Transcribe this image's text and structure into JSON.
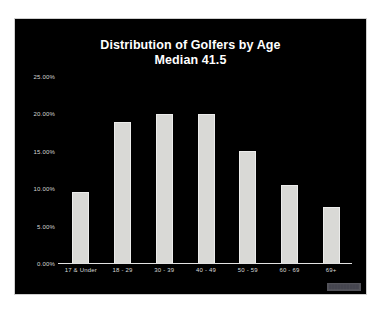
{
  "slide": {
    "background_color": "#000000",
    "band_color": "#8d8d8d",
    "watermark": "██████████"
  },
  "chart_data": {
    "type": "bar",
    "title": "Distribution of Golfers by Age",
    "subtitle": "Median 41.5",
    "xlabel": "",
    "ylabel": "",
    "categories": [
      "17 & Under",
      "18 - 29",
      "30 - 39",
      "40 - 49",
      "50 - 59",
      "60 - 69",
      "69+"
    ],
    "values": [
      9.5,
      19.0,
      20.0,
      20.0,
      15.0,
      10.5,
      7.5
    ],
    "value_labels": [
      "9.50%",
      "19.00%",
      "20.00%",
      "20.00%",
      "15.00%",
      "10.50%",
      "7.50%"
    ],
    "ylim": [
      0,
      25
    ],
    "ytick_values": [
      25,
      20,
      15,
      10,
      5,
      0
    ],
    "ytick_labels": [
      "25.00%",
      "20.00%",
      "15.00%",
      "10.00%",
      "5.00%",
      "0.00%"
    ],
    "grid": false,
    "legend": false,
    "bar_color": "#d9d9d6",
    "text_color": "#ffffff",
    "axis_color": "#e2e2e2"
  }
}
